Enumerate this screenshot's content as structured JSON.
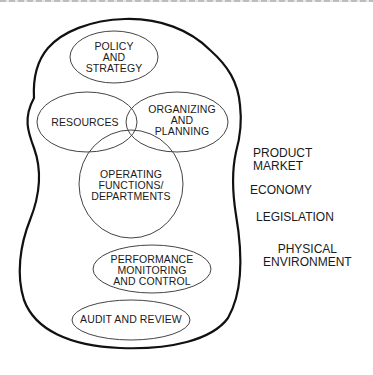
{
  "diagram": {
    "type": "organizational-system-diagram",
    "boundary_label": "organization",
    "internal_elements": [
      {
        "id": "policy",
        "label": "POLICY\nAND\nSTRATEGY"
      },
      {
        "id": "resources",
        "label": "RESOURCES"
      },
      {
        "id": "organizing",
        "label": "ORGANIZING\nAND\nPLANNING"
      },
      {
        "id": "operating",
        "label": "OPERATING\nFUNCTIONS/\nDEPARTMENTS"
      },
      {
        "id": "performance",
        "label": "PERFORMANCE\nMONITORING\nAND CONTROL"
      },
      {
        "id": "audit",
        "label": "AUDIT AND REVIEW"
      }
    ],
    "external_factors": [
      {
        "id": "product-market",
        "label": "PRODUCT\nMARKET"
      },
      {
        "id": "economy",
        "label": "ECONOMY"
      },
      {
        "id": "legislation",
        "label": "LEGISLATION"
      },
      {
        "id": "physical-environment",
        "label": "PHYSICAL\nENVIRONMENT"
      }
    ],
    "colors": {
      "line": "#111111",
      "ellipse_line": "#444444",
      "background": "#ffffff"
    }
  }
}
